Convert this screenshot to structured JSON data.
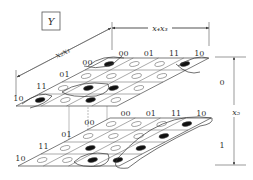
{
  "title_box": {
    "label": "Y"
  },
  "dimensions": {
    "top": {
      "label": "x₄x₃"
    },
    "diagonal": {
      "label": "x₂x₁"
    },
    "right": {
      "label": "x₅",
      "upper": "0",
      "lower": "1"
    }
  },
  "column_labels": [
    "00",
    "01",
    "11",
    "10"
  ],
  "row_labels": [
    "00",
    "01",
    "11",
    "10"
  ],
  "planes": [
    {
      "name": "x5=0",
      "filled": [
        [
          0,
          0
        ],
        [
          0,
          3
        ],
        [
          2,
          1
        ],
        [
          2,
          2
        ],
        [
          3,
          0
        ],
        [
          3,
          2
        ]
      ]
    },
    {
      "name": "x5=1",
      "filled": [
        [
          0,
          3
        ],
        [
          1,
          3
        ],
        [
          2,
          3
        ],
        [
          2,
          1
        ],
        [
          3,
          2
        ],
        [
          3,
          3
        ]
      ]
    }
  ],
  "colors": {
    "line": "#333333",
    "fill": "#111111"
  }
}
